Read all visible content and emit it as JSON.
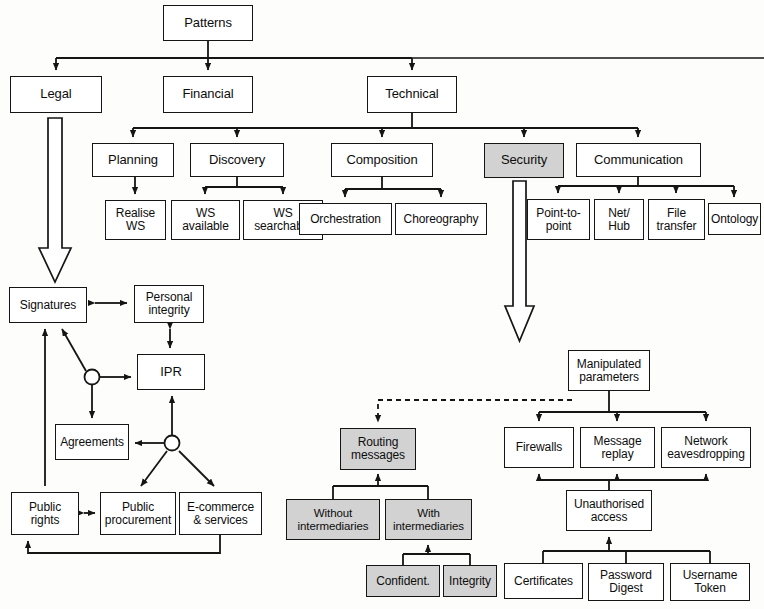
{
  "diagram": {
    "palette": {
      "stroke": "#151515",
      "box_fill": "#ffffff",
      "shaded_fill": "#d2d2d2",
      "background": "#fdfdfc"
    },
    "nodes": [
      {
        "id": "patterns",
        "label": "Patterns",
        "x": 163,
        "y": 5,
        "w": 90,
        "h": 36,
        "shaded": false,
        "size": "normal"
      },
      {
        "id": "legal",
        "label": "Legal",
        "x": 10,
        "y": 76,
        "w": 92,
        "h": 37,
        "shaded": false,
        "size": "normal"
      },
      {
        "id": "financial",
        "label": "Financial",
        "x": 163,
        "y": 76,
        "w": 90,
        "h": 37,
        "shaded": false,
        "size": "normal"
      },
      {
        "id": "technical",
        "label": "Technical",
        "x": 367,
        "y": 76,
        "w": 90,
        "h": 37,
        "shaded": false,
        "size": "normal"
      },
      {
        "id": "planning",
        "label": "Planning",
        "x": 92,
        "y": 143,
        "w": 82,
        "h": 34,
        "shaded": false,
        "size": "normal"
      },
      {
        "id": "discovery",
        "label": "Discovery",
        "x": 190,
        "y": 143,
        "w": 94,
        "h": 34,
        "shaded": false,
        "size": "normal"
      },
      {
        "id": "composition",
        "label": "Composition",
        "x": 331,
        "y": 143,
        "w": 102,
        "h": 34,
        "shaded": false,
        "size": "normal"
      },
      {
        "id": "security",
        "label": "Security",
        "x": 484,
        "y": 143,
        "w": 80,
        "h": 35,
        "shaded": true,
        "size": "normal"
      },
      {
        "id": "communication",
        "label": "Communication",
        "x": 576,
        "y": 143,
        "w": 125,
        "h": 34,
        "shaded": false,
        "size": "normal"
      },
      {
        "id": "realise-ws",
        "label": "Realise\nWS",
        "x": 105,
        "y": 200,
        "w": 61,
        "h": 40,
        "shaded": false,
        "size": "small"
      },
      {
        "id": "ws-available",
        "label": "WS\navailable",
        "x": 171,
        "y": 200,
        "w": 69,
        "h": 40,
        "shaded": false,
        "size": "small"
      },
      {
        "id": "ws-searchable",
        "label": "WS\nsearchable",
        "x": 243,
        "y": 200,
        "w": 80,
        "h": 40,
        "shaded": false,
        "size": "small"
      },
      {
        "id": "orchestration",
        "label": "Orchestration",
        "x": 299,
        "y": 203,
        "w": 93,
        "h": 32,
        "shaded": false,
        "size": "small"
      },
      {
        "id": "choreography",
        "label": "Choreography",
        "x": 395,
        "y": 203,
        "w": 92,
        "h": 32,
        "shaded": false,
        "size": "small"
      },
      {
        "id": "point-to-point",
        "label": "Point-to-\npoint",
        "x": 527,
        "y": 199,
        "w": 63,
        "h": 41,
        "shaded": false,
        "size": "small"
      },
      {
        "id": "net-hub",
        "label": "Net/\nHub",
        "x": 594,
        "y": 199,
        "w": 50,
        "h": 41,
        "shaded": false,
        "size": "small"
      },
      {
        "id": "file-transfer",
        "label": "File\ntransfer",
        "x": 648,
        "y": 199,
        "w": 57,
        "h": 41,
        "shaded": false,
        "size": "small"
      },
      {
        "id": "ontology",
        "label": "Ontology",
        "x": 708,
        "y": 203,
        "w": 53,
        "h": 32,
        "shaded": false,
        "size": "small"
      },
      {
        "id": "signatures",
        "label": "Signatures",
        "x": 9,
        "y": 287,
        "w": 78,
        "h": 36,
        "shaded": false,
        "size": "small"
      },
      {
        "id": "personal-integrity",
        "label": "Personal\nintegrity",
        "x": 134,
        "y": 285,
        "w": 70,
        "h": 38,
        "shaded": false,
        "size": "small"
      },
      {
        "id": "ipr",
        "label": "IPR",
        "x": 137,
        "y": 354,
        "w": 68,
        "h": 36,
        "shaded": false,
        "size": "normal"
      },
      {
        "id": "agreements",
        "label": "Agreements",
        "x": 55,
        "y": 424,
        "w": 74,
        "h": 36,
        "shaded": false,
        "size": "small"
      },
      {
        "id": "public-rights",
        "label": "Public\nrights",
        "x": 11,
        "y": 492,
        "w": 68,
        "h": 43,
        "shaded": false,
        "size": "small"
      },
      {
        "id": "public-procurement",
        "label": "Public\nprocurement",
        "x": 100,
        "y": 492,
        "w": 76,
        "h": 43,
        "shaded": false,
        "size": "small"
      },
      {
        "id": "ecommerce-services",
        "label": "E-commerce\n& services",
        "x": 179,
        "y": 492,
        "w": 83,
        "h": 43,
        "shaded": false,
        "size": "small"
      },
      {
        "id": "routing-messages",
        "label": "Routing\nmessages",
        "x": 340,
        "y": 428,
        "w": 76,
        "h": 42,
        "shaded": true,
        "size": "small"
      },
      {
        "id": "without-intermediaries",
        "label": "Without\nintermediaries",
        "x": 286,
        "y": 499,
        "w": 94,
        "h": 41,
        "shaded": true,
        "size": "tiny"
      },
      {
        "id": "with-intermediaries",
        "label": "With\nintermediaries",
        "x": 385,
        "y": 499,
        "w": 87,
        "h": 41,
        "shaded": true,
        "size": "tiny"
      },
      {
        "id": "confidentiality",
        "label": "Confident.",
        "x": 366,
        "y": 565,
        "w": 74,
        "h": 32,
        "shaded": true,
        "size": "small"
      },
      {
        "id": "integrity",
        "label": "Integrity",
        "x": 443,
        "y": 565,
        "w": 54,
        "h": 32,
        "shaded": true,
        "size": "small"
      },
      {
        "id": "manipulated-parameters",
        "label": "Manipulated\nparameters",
        "x": 568,
        "y": 350,
        "w": 82,
        "h": 41,
        "shaded": false,
        "size": "small"
      },
      {
        "id": "firewalls",
        "label": "Firewalls",
        "x": 504,
        "y": 427,
        "w": 70,
        "h": 41,
        "shaded": false,
        "size": "small"
      },
      {
        "id": "message-replay",
        "label": "Message\nreplay",
        "x": 580,
        "y": 427,
        "w": 75,
        "h": 41,
        "shaded": false,
        "size": "small"
      },
      {
        "id": "network-eavesdropping",
        "label": "Network\neavesdropping",
        "x": 661,
        "y": 427,
        "w": 90,
        "h": 41,
        "shaded": false,
        "size": "small"
      },
      {
        "id": "unauthorised-access",
        "label": "Unauthorised\naccess",
        "x": 566,
        "y": 490,
        "w": 86,
        "h": 41,
        "shaded": false,
        "size": "small"
      },
      {
        "id": "certificates",
        "label": "Certificates",
        "x": 504,
        "y": 563,
        "w": 79,
        "h": 36,
        "shaded": false,
        "size": "small"
      },
      {
        "id": "password-digest",
        "label": "Password\nDigest",
        "x": 588,
        "y": 563,
        "w": 76,
        "h": 38,
        "shaded": false,
        "size": "small"
      },
      {
        "id": "username-token",
        "label": "Username\nToken",
        "x": 670,
        "y": 563,
        "w": 80,
        "h": 38,
        "shaded": false,
        "size": "small"
      }
    ],
    "block_arrows": [
      {
        "id": "legal-to-signatures-arrow",
        "from": "legal",
        "to": "signatures-cluster"
      },
      {
        "id": "security-to-security-detail-arrow",
        "from": "security",
        "to": "security-detail-cluster"
      }
    ],
    "edges": [
      {
        "id": "patterns-legal",
        "kind": "tree"
      },
      {
        "id": "patterns-financial",
        "kind": "tree"
      },
      {
        "id": "patterns-technical",
        "kind": "tree"
      },
      {
        "id": "technical-planning",
        "kind": "tree"
      },
      {
        "id": "technical-discovery",
        "kind": "tree"
      },
      {
        "id": "technical-composition",
        "kind": "tree"
      },
      {
        "id": "technical-security",
        "kind": "tree"
      },
      {
        "id": "technical-communication",
        "kind": "tree"
      },
      {
        "id": "planning-realise-ws",
        "kind": "tree"
      },
      {
        "id": "discovery-ws-available",
        "kind": "tree"
      },
      {
        "id": "discovery-ws-searchable",
        "kind": "tree"
      },
      {
        "id": "composition-orchestration",
        "kind": "tree"
      },
      {
        "id": "composition-choreography",
        "kind": "tree"
      },
      {
        "id": "communication-point-to-point",
        "kind": "tree"
      },
      {
        "id": "communication-net-hub",
        "kind": "tree"
      },
      {
        "id": "communication-file-transfer",
        "kind": "tree"
      },
      {
        "id": "communication-ontology",
        "kind": "tree"
      },
      {
        "id": "signatures-personal-integrity",
        "kind": "bidirectional"
      },
      {
        "id": "personal-integrity-ipr",
        "kind": "bidirectional"
      },
      {
        "id": "junction1-signatures",
        "kind": "directed"
      },
      {
        "id": "junction1-ipr",
        "kind": "directed"
      },
      {
        "id": "junction1-agreements",
        "kind": "directed"
      },
      {
        "id": "junction2-ipr",
        "kind": "directed"
      },
      {
        "id": "junction2-agreements",
        "kind": "directed"
      },
      {
        "id": "junction2-public-procurement",
        "kind": "directed"
      },
      {
        "id": "junction2-ecommerce",
        "kind": "directed"
      },
      {
        "id": "public-rights-signatures",
        "kind": "directed"
      },
      {
        "id": "public-rights-public-procurement",
        "kind": "bidirectional"
      },
      {
        "id": "ecommerce-public-rights-return",
        "kind": "directed"
      },
      {
        "id": "manipulated-parameters-routing-messages",
        "kind": "dashed"
      },
      {
        "id": "without-intermediaries-routing",
        "kind": "tree-up"
      },
      {
        "id": "with-intermediaries-routing",
        "kind": "tree-up"
      },
      {
        "id": "confidentiality-with-intermediaries",
        "kind": "tree-up"
      },
      {
        "id": "integrity-with-intermediaries",
        "kind": "tree-up"
      },
      {
        "id": "manipulated-firewalls",
        "kind": "tree"
      },
      {
        "id": "manipulated-message-replay",
        "kind": "tree"
      },
      {
        "id": "manipulated-network-eavesdropping",
        "kind": "tree"
      },
      {
        "id": "unauthorised-firewalls",
        "kind": "tree-up"
      },
      {
        "id": "unauthorised-message-replay",
        "kind": "tree-up"
      },
      {
        "id": "unauthorised-network-eavesdropping",
        "kind": "tree-up"
      },
      {
        "id": "certificates-unauthorised",
        "kind": "tree-up"
      },
      {
        "id": "password-digest-unauthorised",
        "kind": "tree-up"
      },
      {
        "id": "username-token-unauthorised",
        "kind": "tree-up"
      }
    ]
  }
}
